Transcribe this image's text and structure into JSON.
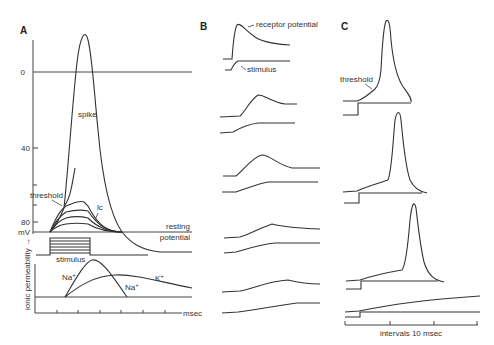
{
  "figure": {
    "panels": [
      {
        "id": "A",
        "label": "A",
        "y_ticks": [
          "0",
          "40",
          "80"
        ],
        "y_unit": "mV",
        "labels": {
          "spike": "spike",
          "threshold": "threshold",
          "lc": "lc",
          "resting": "resting",
          "potential": "potential",
          "stimulus": "stimulus",
          "na_rise": "Na",
          "na_fall": "Na",
          "k": "K",
          "plus": "+",
          "ionic_permeability": "ionic permeability →",
          "x_unit": "msec"
        }
      },
      {
        "id": "B",
        "label": "B",
        "labels": {
          "receptor_potential": "receptor potential",
          "stimulus": "stimulus"
        },
        "trace_pairs": 5
      },
      {
        "id": "C",
        "label": "C",
        "labels": {
          "threshold": "threshold",
          "x_axis": "intervals 10 msec"
        },
        "trace_pairs": 4
      }
    ]
  }
}
